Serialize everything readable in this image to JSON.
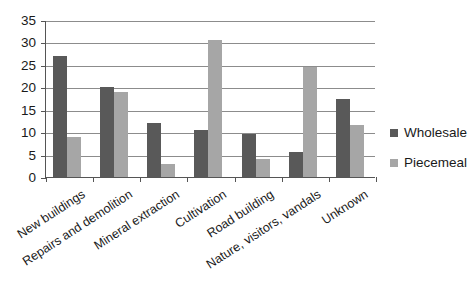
{
  "chart_data": {
    "type": "bar",
    "title": "",
    "subtitle": "",
    "xlabel": "",
    "ylabel": "",
    "ylim": [
      0,
      35
    ],
    "yticks": [
      0,
      5,
      10,
      15,
      20,
      25,
      30,
      35
    ],
    "ytick_labels": [
      "0",
      "5",
      "10",
      "15",
      "20",
      "25",
      "30",
      "35"
    ],
    "grid": true,
    "legend_position": "right",
    "categories": [
      "New buildings",
      "Repairs and demolition",
      "Mineral extraction",
      "Cultivation",
      "Road building",
      "Nature, visitors, vandals",
      "Unknown"
    ],
    "series": [
      {
        "name": "Wholesale",
        "color": "#595959",
        "values": [
          27,
          20,
          12,
          10.5,
          9.5,
          5.5,
          17.5
        ]
      },
      {
        "name": "Piecemeal",
        "color": "#a6a6a6",
        "values": [
          9,
          19,
          3,
          30.5,
          4,
          24.5,
          11.5
        ]
      }
    ]
  },
  "legend": {
    "items": [
      {
        "label": "Wholesale",
        "color": "#595959",
        "swatch_icon": "square-swatch-icon"
      },
      {
        "label": "Piecemeal",
        "color": "#a6a6a6",
        "swatch_icon": "square-swatch-icon"
      }
    ]
  },
  "axis_colors": {
    "axis_line": "#555555",
    "gridline": "#8c8c8c",
    "text": "#1a1a1a",
    "background": "#ffffff"
  }
}
